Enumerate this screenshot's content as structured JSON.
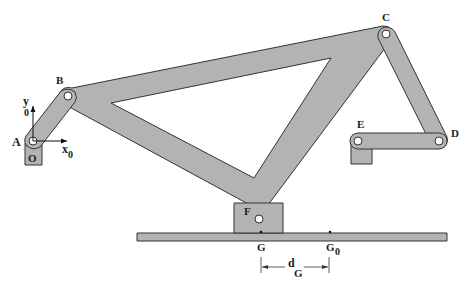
{
  "figure": {
    "colors": {
      "link_fill": "#b3b3b3",
      "outline": "#333333",
      "background": "#ffffff"
    }
  },
  "labels": {
    "A": "A",
    "B": "B",
    "C": "C",
    "D": "D",
    "E": "E",
    "F": "F",
    "O": "O",
    "G": "G",
    "G0_main": "G",
    "G0_sub": "0",
    "x0_main": "x",
    "x0_sub": "0",
    "y0_main": "y",
    "y0_sub": "0",
    "dG_main": "d",
    "dG_sub": "G"
  }
}
